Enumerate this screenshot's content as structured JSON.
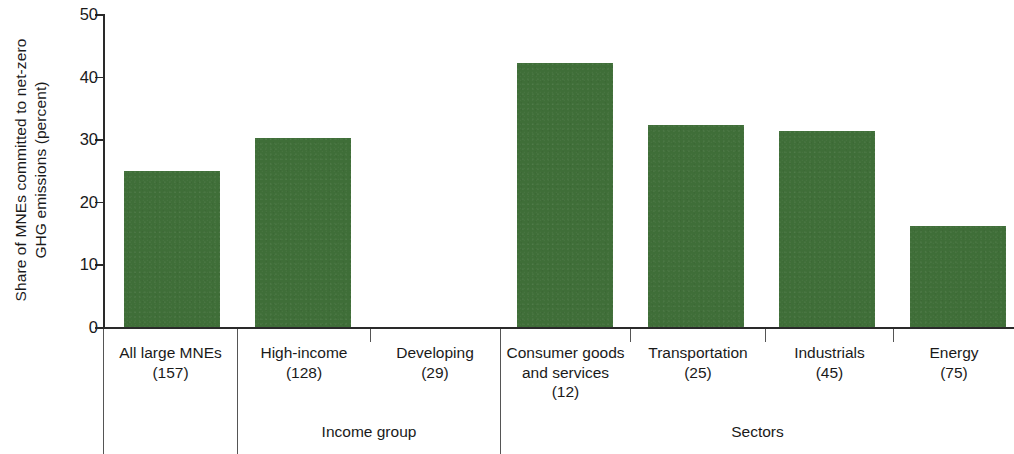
{
  "chart_data": {
    "type": "bar",
    "title": "",
    "xlabel": "",
    "ylabel": "Share of MNEs committed to net-zero\nGHG emissions (percent)",
    "ylim": [
      0,
      50
    ],
    "yticks": [
      0,
      10,
      20,
      30,
      40,
      50
    ],
    "ytick_labels": [
      "0",
      "10",
      "20",
      "30",
      "40",
      "50"
    ],
    "grid": false,
    "legend": null,
    "bar_color": "#3f6e38",
    "axis_color": "#2a2a2a",
    "categories": [
      "All large MNEs\n(157)",
      "High-income\n(128)",
      "Developing\n(29)",
      "Consumer goods\nand services\n(12)",
      "Transportation\n(25)",
      "Industrials\n(45)",
      "Energy\n(75)"
    ],
    "category_names": [
      "All large MNEs",
      "High-income",
      "Developing",
      "Consumer goods and services",
      "Transportation",
      "Industrials",
      "Energy"
    ],
    "category_counts": [
      157,
      128,
      29,
      12,
      25,
      45,
      75
    ],
    "values": [
      24.9,
      30.2,
      0,
      42.2,
      32.3,
      31.3,
      16.2
    ],
    "groups": [
      {
        "label": "Income group",
        "categories": [
          "High-income\n(128)",
          "Developing\n(29)"
        ]
      },
      {
        "label": "Sectors",
        "categories": [
          "Consumer goods\nand services\n(12)",
          "Transportation\n(25)",
          "Industrials\n(45)",
          "Energy\n(75)"
        ]
      }
    ]
  },
  "axis": {
    "y_title": "Share of MNEs committed to net-zero\nGHG emissions (percent)",
    "ticks": {
      "t0": "0",
      "t1": "10",
      "t2": "20",
      "t3": "30",
      "t4": "40",
      "t5": "50"
    }
  },
  "categories": {
    "c0": "All large MNEs\n(157)",
    "c1": "High-income\n(128)",
    "c2": "Developing\n(29)",
    "c3": "Consumer goods\nand services\n(12)",
    "c4": "Transportation\n(25)",
    "c5": "Industrials\n(45)",
    "c6": "Energy\n(75)"
  },
  "groups": {
    "g0": "Income group",
    "g1": "Sectors"
  }
}
